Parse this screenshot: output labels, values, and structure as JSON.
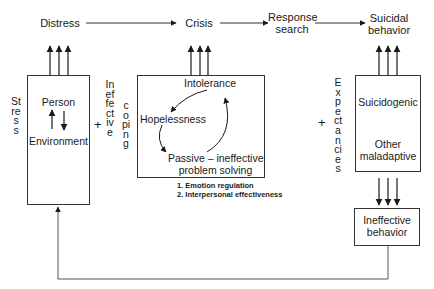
{
  "diagram": {
    "top_row": {
      "distress": "Distress",
      "crisis": "Crisis",
      "response_search_line1": "Response",
      "response_search_line2": "search",
      "suicidal_behavior_line1": "Suicidal",
      "suicidal_behavior_line2": "behavior"
    },
    "left_block": {
      "side_label": "Stress",
      "box_top": "Person",
      "box_bottom": "Environment"
    },
    "ineffective_coping": {
      "word1": "Ineffective",
      "word2": "coping",
      "operator": "+"
    },
    "middle_block": {
      "intolerance": "Intolerance",
      "hopelessness": "Hopelessness",
      "passive_line1": "Passive – ineffective",
      "passive_line2": "problem solving",
      "notes": [
        "1.  Emotion regulation",
        "2.  Interpersonal effectiveness"
      ]
    },
    "right_block": {
      "operator": "+",
      "side_label": "Expectancies",
      "box_top": "Suicidogenic",
      "box_bottom_line1": "Other",
      "box_bottom_line2": "maladaptive"
    },
    "outcome_box": {
      "line1": "Ineffective",
      "line2": "behavior"
    },
    "colors": {
      "ink": "#1a1a1a",
      "line": "#333333",
      "background": "#ffffff"
    }
  }
}
